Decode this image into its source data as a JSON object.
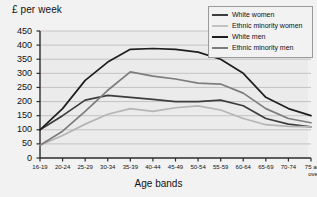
{
  "chart_data": {
    "type": "line",
    "title": "",
    "ylabel": "£ per week",
    "xlabel": "Age bands",
    "ylim": [
      0,
      450
    ],
    "ytick_step": 50,
    "yticks": [
      "0",
      "50",
      "100",
      "150",
      "200",
      "250",
      "300",
      "350",
      "400",
      "450"
    ],
    "grid": true,
    "legend_position": "top-right",
    "categories": [
      "16-19",
      "20-24",
      "25-29",
      "30-34",
      "35-39",
      "40-44",
      "45-49",
      "50-54",
      "55-59",
      "60-64",
      "65-69",
      "70-74",
      "75 and over"
    ],
    "series": [
      {
        "name": "White women",
        "color": "#3d3d3d",
        "values": [
          100,
          150,
          205,
          222,
          215,
          208,
          200,
          200,
          205,
          185,
          140,
          120,
          110
        ]
      },
      {
        "name": "Ethnic minority women",
        "color": "#b5b5b5",
        "values": [
          45,
          80,
          120,
          155,
          175,
          165,
          178,
          185,
          170,
          140,
          118,
          112,
          110
        ]
      },
      {
        "name": "White men",
        "color": "#1f1f1f",
        "values": [
          100,
          175,
          275,
          340,
          385,
          388,
          385,
          375,
          350,
          300,
          215,
          175,
          150
        ]
      },
      {
        "name": "Ethnic minority men",
        "color": "#7d7d7d",
        "values": [
          45,
          95,
          165,
          240,
          305,
          290,
          280,
          265,
          262,
          230,
          175,
          140,
          125
        ]
      }
    ]
  },
  "legend": {
    "items": [
      {
        "label": "White women"
      },
      {
        "label": "Ethnic minority women"
      },
      {
        "label": "White men"
      },
      {
        "label": "Ethnic minority men"
      }
    ]
  }
}
